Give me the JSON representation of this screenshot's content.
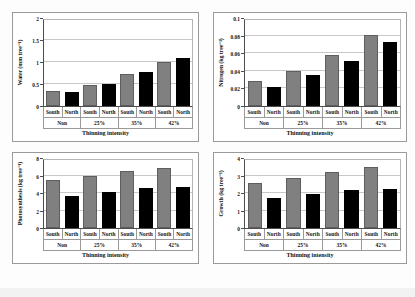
{
  "figure": {
    "background_color": "#fdfdfd",
    "panel_border_color": "#9a9a9a",
    "south_color": "#808080",
    "north_color": "#000000",
    "xtitle": "Thinning intensity",
    "groups": [
      "Non",
      "25%",
      "35%",
      "42%"
    ],
    "subcategories": [
      "South",
      "North",
      "South",
      "North",
      "South",
      "North",
      "South",
      "North"
    ]
  },
  "chart_data": [
    {
      "type": "bar",
      "title": "",
      "panel": "water",
      "ylabel": "Water (mm tree⁻¹)",
      "xlabel": "Thinning intensity",
      "categories": [
        "Non",
        "25%",
        "35%",
        "42%"
      ],
      "ylim": [
        0,
        2
      ],
      "yticks": [
        0,
        0.5,
        1,
        1.5,
        2
      ],
      "ytick_labels": [
        "0",
        "0.5",
        "1",
        "1.5",
        "2"
      ],
      "grid": true,
      "legend": "none",
      "series": [
        {
          "name": "South",
          "values": [
            0.33,
            0.48,
            0.72,
            1.01
          ]
        },
        {
          "name": "North",
          "values": [
            0.32,
            0.5,
            0.77,
            1.1
          ]
        }
      ],
      "bars": [
        {
          "group": "Non",
          "aspect": "South",
          "value": 0.33
        },
        {
          "group": "Non",
          "aspect": "North",
          "value": 0.32
        },
        {
          "group": "25%",
          "aspect": "South",
          "value": 0.48
        },
        {
          "group": "25%",
          "aspect": "North",
          "value": 0.5
        },
        {
          "group": "35%",
          "aspect": "South",
          "value": 0.72
        },
        {
          "group": "35%",
          "aspect": "North",
          "value": 0.77
        },
        {
          "group": "42%",
          "aspect": "South",
          "value": 1.01
        },
        {
          "group": "42%",
          "aspect": "North",
          "value": 1.1
        }
      ]
    },
    {
      "type": "bar",
      "title": "",
      "panel": "nitrogen",
      "ylabel": "Nitrogen (kg tree⁻¹)",
      "xlabel": "Thinning intensity",
      "categories": [
        "Non",
        "25%",
        "35%",
        "42%"
      ],
      "ylim": [
        0,
        0.1
      ],
      "yticks": [
        0,
        0.02,
        0.04,
        0.06,
        0.08,
        0.1
      ],
      "ytick_labels": [
        "0",
        "0.02",
        "0.04",
        "0.06",
        "0.08",
        "0.1"
      ],
      "grid": true,
      "legend": "none",
      "series": [
        {
          "name": "South",
          "values": [
            0.028,
            0.04,
            0.058,
            0.081
          ]
        },
        {
          "name": "North",
          "values": [
            0.022,
            0.035,
            0.051,
            0.073
          ]
        }
      ],
      "bars": [
        {
          "group": "Non",
          "aspect": "South",
          "value": 0.028
        },
        {
          "group": "Non",
          "aspect": "North",
          "value": 0.022
        },
        {
          "group": "25%",
          "aspect": "South",
          "value": 0.04
        },
        {
          "group": "25%",
          "aspect": "North",
          "value": 0.035
        },
        {
          "group": "35%",
          "aspect": "South",
          "value": 0.058
        },
        {
          "group": "35%",
          "aspect": "North",
          "value": 0.051
        },
        {
          "group": "42%",
          "aspect": "South",
          "value": 0.081
        },
        {
          "group": "42%",
          "aspect": "North",
          "value": 0.073
        }
      ]
    },
    {
      "type": "bar",
      "title": "",
      "panel": "photosynthesis",
      "ylabel": "Photosynthesis (kg tree⁻¹)",
      "xlabel": "Thinning intensity",
      "categories": [
        "Non",
        "25%",
        "35%",
        "42%"
      ],
      "ylim": [
        0,
        8
      ],
      "yticks": [
        0,
        2,
        4,
        6,
        8
      ],
      "ytick_labels": [
        "0",
        "2",
        "4",
        "6",
        "8"
      ],
      "grid": true,
      "legend": "none",
      "series": [
        {
          "name": "South",
          "values": [
            5.5,
            6.0,
            6.55,
            6.9
          ]
        },
        {
          "name": "North",
          "values": [
            3.65,
            4.1,
            4.55,
            4.7
          ]
        }
      ],
      "bars": [
        {
          "group": "Non",
          "aspect": "South",
          "value": 5.5
        },
        {
          "group": "Non",
          "aspect": "North",
          "value": 3.65
        },
        {
          "group": "25%",
          "aspect": "South",
          "value": 6.0
        },
        {
          "group": "25%",
          "aspect": "North",
          "value": 4.1
        },
        {
          "group": "35%",
          "aspect": "South",
          "value": 6.55
        },
        {
          "group": "35%",
          "aspect": "North",
          "value": 4.55
        },
        {
          "group": "42%",
          "aspect": "South",
          "value": 6.9
        },
        {
          "group": "42%",
          "aspect": "North",
          "value": 4.7
        }
      ]
    },
    {
      "type": "bar",
      "title": "",
      "panel": "growth",
      "ylabel": "Growth (kg tree⁻¹)",
      "xlabel": "Thinning intensity",
      "categories": [
        "Non",
        "25%",
        "35%",
        "42%"
      ],
      "ylim": [
        0,
        4
      ],
      "yticks": [
        0,
        1,
        2,
        3,
        4
      ],
      "ytick_labels": [
        "0",
        "1",
        "2",
        "3",
        "4"
      ],
      "grid": true,
      "legend": "none",
      "series": [
        {
          "name": "South",
          "values": [
            2.6,
            2.87,
            3.18,
            3.5
          ]
        },
        {
          "name": "North",
          "values": [
            1.7,
            1.97,
            2.17,
            2.25
          ]
        }
      ],
      "bars": [
        {
          "group": "Non",
          "aspect": "South",
          "value": 2.6
        },
        {
          "group": "Non",
          "aspect": "North",
          "value": 1.7
        },
        {
          "group": "25%",
          "aspect": "South",
          "value": 2.87
        },
        {
          "group": "25%",
          "aspect": "North",
          "value": 1.97
        },
        {
          "group": "35%",
          "aspect": "South",
          "value": 3.18
        },
        {
          "group": "35%",
          "aspect": "North",
          "value": 2.17
        },
        {
          "group": "42%",
          "aspect": "South",
          "value": 3.5
        },
        {
          "group": "42%",
          "aspect": "North",
          "value": 2.25
        }
      ]
    }
  ]
}
